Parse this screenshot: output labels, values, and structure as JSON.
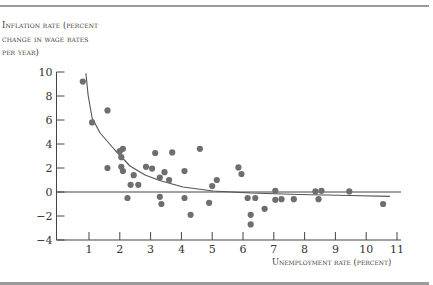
{
  "chart_data": {
    "type": "scatter",
    "title": "",
    "xlabel": "Unemployment rate (percent)",
    "ylabel": "Inflation rate (percent change in wage rates per year)",
    "ylabel_lines": [
      "Inflation rate (percent",
      "change in wage rates",
      "per year)"
    ],
    "xlim": [
      0,
      11
    ],
    "ylim": [
      -4,
      10
    ],
    "x_ticks": [
      1,
      2,
      3,
      4,
      5,
      6,
      7,
      8,
      9,
      10,
      11
    ],
    "y_ticks": [
      -4,
      -2,
      0,
      2,
      4,
      6,
      8,
      10
    ],
    "grid": false,
    "zero_line": true,
    "series": [
      {
        "name": "Observations",
        "type": "scatter",
        "color": "#6e6e6e",
        "points": [
          [
            0.8,
            9.2
          ],
          [
            1.1,
            5.8
          ],
          [
            1.6,
            6.8
          ],
          [
            1.6,
            2.0
          ],
          [
            2.0,
            3.4
          ],
          [
            2.1,
            3.6
          ],
          [
            2.05,
            2.9
          ],
          [
            2.05,
            2.1
          ],
          [
            2.1,
            1.75
          ],
          [
            2.45,
            1.4
          ],
          [
            2.35,
            0.6
          ],
          [
            2.6,
            0.6
          ],
          [
            2.25,
            -0.5
          ],
          [
            2.85,
            2.1
          ],
          [
            3.05,
            1.95
          ],
          [
            3.15,
            3.25
          ],
          [
            3.45,
            1.65
          ],
          [
            3.3,
            1.2
          ],
          [
            3.6,
            1.0
          ],
          [
            3.7,
            3.3
          ],
          [
            4.1,
            1.75
          ],
          [
            3.3,
            -0.4
          ],
          [
            3.35,
            -1.0
          ],
          [
            4.1,
            -0.5
          ],
          [
            4.3,
            -1.9
          ],
          [
            4.6,
            3.6
          ],
          [
            4.9,
            -0.9
          ],
          [
            5.0,
            0.5
          ],
          [
            5.15,
            1.0
          ],
          [
            5.85,
            2.05
          ],
          [
            5.95,
            1.5
          ],
          [
            6.15,
            -0.5
          ],
          [
            6.25,
            -1.9
          ],
          [
            6.25,
            -2.7
          ],
          [
            6.4,
            -0.5
          ],
          [
            6.7,
            -1.4
          ],
          [
            7.05,
            0.1
          ],
          [
            7.05,
            -0.65
          ],
          [
            7.25,
            -0.6
          ],
          [
            7.65,
            -0.6
          ],
          [
            8.35,
            0.05
          ],
          [
            8.45,
            -0.6
          ],
          [
            8.55,
            0.1
          ],
          [
            9.45,
            0.05
          ],
          [
            10.55,
            -1.0
          ]
        ]
      },
      {
        "name": "Phillips curve",
        "type": "line",
        "color": "#555555",
        "points": [
          [
            0.9,
            9.9
          ],
          [
            0.97,
            8.08
          ],
          [
            1.1,
            6.17
          ],
          [
            1.36,
            4.92
          ],
          [
            1.84,
            3.5
          ],
          [
            2.33,
            2.17
          ],
          [
            2.82,
            1.42
          ],
          [
            3.3,
            0.96
          ],
          [
            4.05,
            0.42
          ],
          [
            5.03,
            0.08
          ],
          [
            6.23,
            -0.08
          ],
          [
            7.85,
            -0.21
          ],
          [
            9.47,
            -0.29
          ],
          [
            10.77,
            -0.37
          ]
        ]
      }
    ]
  },
  "labels": {
    "y_line1": "Inflation rate (percent",
    "y_line2": "change in wage rates",
    "y_line3": "per year)",
    "x": "Unemployment rate (percent)"
  }
}
